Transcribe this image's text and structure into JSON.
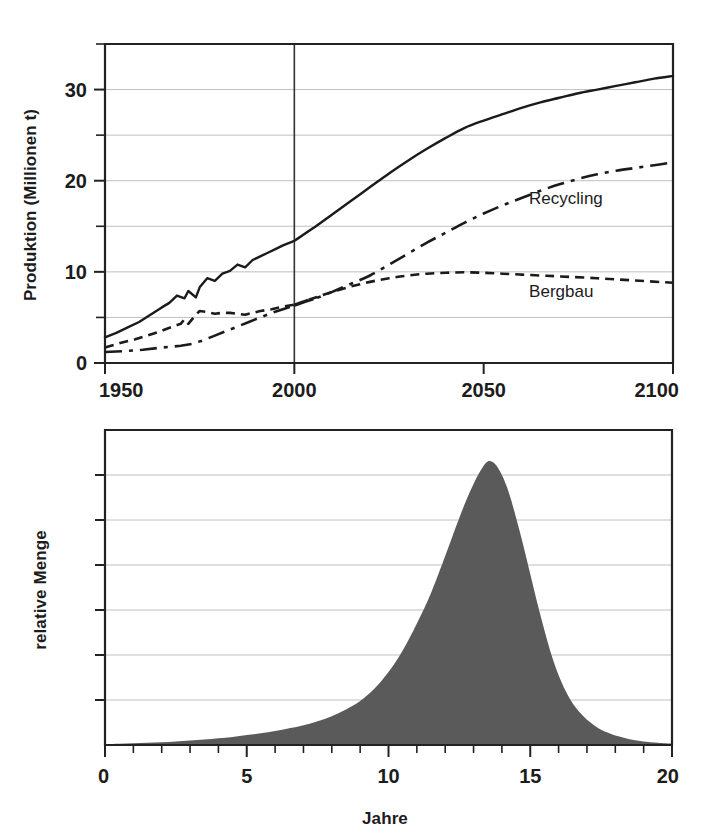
{
  "figure": {
    "title": "",
    "background_color": "#ffffff",
    "ink_color": "#1b1b1b",
    "grid_color": "#b9b9b9"
  },
  "chart_data": [
    {
      "id": "produktion-chart",
      "type": "line",
      "title": "",
      "subtitle": "",
      "xlabel": "",
      "ylabel": "Produktion (Millionen t)",
      "xlim": [
        1950,
        2100
      ],
      "ylim": [
        0,
        35
      ],
      "grid": true,
      "grid_axis": "y",
      "legend_position": "inline-annotation",
      "xticks": [
        1950,
        2000,
        2050,
        2100
      ],
      "xtick_labels": [
        "1950",
        "2000",
        "2050",
        "2100"
      ],
      "xminor_ticks": [],
      "yticks": [
        0,
        10,
        20,
        30
      ],
      "ytick_labels": [
        "0",
        "10",
        "20",
        "30"
      ],
      "yminor_ticks": [
        5,
        15,
        25,
        35
      ],
      "gridlines_y": [
        5,
        10,
        15,
        20,
        25,
        30
      ],
      "annotations": [
        {
          "text": "Recycling",
          "x": 2062,
          "y": 17.4
        },
        {
          "text": "Bergbau",
          "x": 2062,
          "y": 7.2
        }
      ],
      "vertical_markers": [
        {
          "x": 2000,
          "label": ""
        }
      ],
      "series": [
        {
          "name": "Gesamtproduktion",
          "style": "solid",
          "color": "#1b1b1b",
          "x": [
            1950,
            1953,
            1956,
            1959,
            1962,
            1965,
            1967,
            1969,
            1971,
            1972,
            1974,
            1975,
            1977,
            1979,
            1981,
            1983,
            1985,
            1987,
            1989,
            1991,
            1993,
            1995,
            1997,
            2000,
            2005,
            2010,
            2015,
            2020,
            2025,
            2030,
            2035,
            2040,
            2045,
            2050,
            2055,
            2060,
            2065,
            2070,
            2075,
            2080,
            2085,
            2090,
            2095,
            2100
          ],
          "y": [
            2.8,
            3.3,
            3.9,
            4.5,
            5.3,
            6.1,
            6.6,
            7.4,
            7.1,
            7.9,
            7.2,
            8.3,
            9.3,
            9.0,
            9.8,
            10.1,
            10.8,
            10.5,
            11.3,
            11.7,
            12.1,
            12.5,
            12.9,
            13.4,
            14.8,
            16.3,
            17.8,
            19.3,
            20.8,
            22.2,
            23.5,
            24.7,
            25.8,
            26.6,
            27.3,
            28.0,
            28.6,
            29.1,
            29.6,
            30.0,
            30.4,
            30.8,
            31.2,
            31.5
          ]
        },
        {
          "name": "Bergbau",
          "style": "dashed",
          "color": "#1b1b1b",
          "x": [
            1950,
            1954,
            1958,
            1961,
            1964,
            1966,
            1968,
            1970,
            1971,
            1972,
            1974,
            1975,
            1977,
            1979,
            1981,
            1983,
            1985,
            1987,
            1989,
            1991,
            1994,
            1997,
            2000,
            2005,
            2010,
            2015,
            2020,
            2025,
            2030,
            2035,
            2040,
            2045,
            2050,
            2055,
            2060,
            2065,
            2070,
            2080,
            2090,
            2100
          ],
          "y": [
            1.7,
            2.2,
            2.6,
            3.0,
            3.4,
            3.7,
            4.0,
            4.3,
            4.8,
            4.3,
            5.3,
            5.7,
            5.6,
            5.4,
            5.5,
            5.5,
            5.4,
            5.3,
            5.5,
            5.7,
            5.9,
            6.2,
            6.4,
            7.1,
            7.8,
            8.4,
            8.9,
            9.3,
            9.6,
            9.8,
            9.9,
            9.95,
            9.9,
            9.8,
            9.7,
            9.6,
            9.5,
            9.3,
            9.05,
            8.8
          ]
        },
        {
          "name": "Recycling",
          "style": "dashdot",
          "color": "#1b1b1b",
          "x": [
            1950,
            1955,
            1960,
            1965,
            1968,
            1970,
            1973,
            1976,
            1979,
            1982,
            1985,
            1988,
            1991,
            1994,
            1997,
            2000,
            2005,
            2010,
            2015,
            2020,
            2025,
            2030,
            2035,
            2040,
            2045,
            2050,
            2055,
            2060,
            2065,
            2070,
            2075,
            2080,
            2085,
            2090,
            2095,
            2100
          ],
          "y": [
            1.2,
            1.3,
            1.45,
            1.7,
            1.8,
            1.9,
            2.1,
            2.5,
            3.0,
            3.5,
            4.0,
            4.5,
            5.0,
            5.5,
            5.9,
            6.3,
            7.0,
            7.8,
            8.7,
            9.6,
            10.8,
            12.0,
            13.2,
            14.3,
            15.4,
            16.4,
            17.3,
            18.1,
            18.9,
            19.6,
            20.2,
            20.7,
            21.1,
            21.4,
            21.7,
            22.0
          ]
        }
      ]
    },
    {
      "id": "relative-menge-chart",
      "type": "area",
      "title": "",
      "subtitle": "",
      "xlabel": "Jahre",
      "ylabel": "relative Menge",
      "xlim": [
        0,
        20
      ],
      "ylim": [
        0,
        7
      ],
      "grid": true,
      "grid_axis": "y",
      "legend_position": "none",
      "xticks": [
        0,
        5,
        10,
        15,
        20
      ],
      "xtick_labels": [
        "0",
        "5",
        "10",
        "15",
        "20"
      ],
      "xminor_ticks": [
        1,
        2,
        3,
        4,
        6,
        7,
        8,
        9,
        11,
        12,
        13,
        14,
        16,
        17,
        18,
        19
      ],
      "yticks": [],
      "ytick_labels": [],
      "yminor_ticks": [
        1,
        2,
        3,
        4,
        5,
        6
      ],
      "gridlines_y": [
        1,
        2,
        3,
        4,
        5,
        6
      ],
      "fill_color": "#5a5a5a",
      "peak_x": 13.5,
      "peak_y": 6.3,
      "series": [
        {
          "name": "relative Menge",
          "style": "filled-area",
          "color": "#5a5a5a",
          "x": [
            0,
            0.5,
            1,
            1.5,
            2,
            2.5,
            3,
            3.5,
            4,
            4.5,
            5,
            5.5,
            6,
            6.5,
            7,
            7.5,
            8,
            8.5,
            9,
            9.5,
            10,
            10.5,
            11,
            11.5,
            12,
            12.25,
            12.5,
            12.75,
            13,
            13.25,
            13.5,
            13.75,
            14,
            14.25,
            14.5,
            14.75,
            15,
            15.25,
            15.5,
            15.75,
            16,
            16.25,
            16.5,
            16.75,
            17,
            17.25,
            17.5,
            17.75,
            18,
            18.5,
            19,
            19.5,
            20
          ],
          "y": [
            0.02,
            0.03,
            0.04,
            0.05,
            0.06,
            0.08,
            0.1,
            0.12,
            0.15,
            0.18,
            0.22,
            0.26,
            0.31,
            0.37,
            0.44,
            0.53,
            0.64,
            0.79,
            0.98,
            1.25,
            1.62,
            2.1,
            2.7,
            3.38,
            4.2,
            4.63,
            5.05,
            5.45,
            5.8,
            6.1,
            6.3,
            6.25,
            6.0,
            5.6,
            5.05,
            4.45,
            3.8,
            3.15,
            2.55,
            2.0,
            1.55,
            1.2,
            0.92,
            0.72,
            0.56,
            0.44,
            0.34,
            0.27,
            0.21,
            0.13,
            0.08,
            0.05,
            0.03
          ]
        }
      ]
    }
  ],
  "labels": {
    "y_axis_top": "Produktion (Millionen t)",
    "y_axis_bottom": "relative Menge",
    "x_axis_bottom": "Jahre",
    "series_recycling": "Recycling",
    "series_bergbau": "Bergbau",
    "top_xticks": [
      "1950",
      "2000",
      "2050",
      "2100"
    ],
    "top_yticks": [
      "0",
      "10",
      "20",
      "30"
    ],
    "bottom_xticks": [
      "0",
      "5",
      "10",
      "15",
      "20"
    ]
  }
}
